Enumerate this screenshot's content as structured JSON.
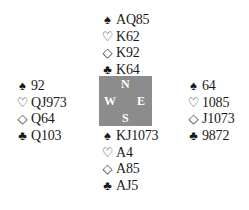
{
  "icons": {
    "spade": "♠",
    "heart": "♡",
    "diamond": "◇",
    "club": "♣"
  },
  "compass": {
    "north": "N",
    "west": "W",
    "east": "E",
    "south": "S",
    "background_color": "#8c8c8c",
    "letter_color": "#ffffff"
  },
  "hands": {
    "north": {
      "spades": "AQ85",
      "hearts": "K62",
      "diamonds": "K92",
      "clubs": "K64"
    },
    "west": {
      "spades": "92",
      "hearts": "QJ973",
      "diamonds": "Q64",
      "clubs": "Q103"
    },
    "east": {
      "spades": "64",
      "hearts": "1085",
      "diamonds": "J1073",
      "clubs": "9872"
    },
    "south": {
      "spades": "KJ1073",
      "hearts": "A4",
      "diamonds": "A85",
      "clubs": "AJ5"
    }
  }
}
